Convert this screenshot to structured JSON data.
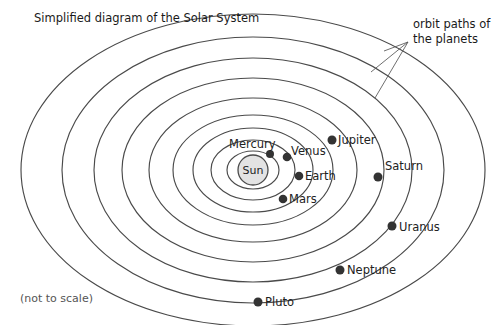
{
  "title": "Simplified diagram of the Solar System",
  "footnote": "(not to scale)",
  "annotation": {
    "line1": "orbit paths of",
    "line2": "the planets"
  },
  "sun": {
    "label": "Sun",
    "cx": 253,
    "cy": 170,
    "r": 15,
    "fill": "#e3e3e3",
    "stroke": "#4a4a4a"
  },
  "colors": {
    "orbit_stroke": "#4a4a4a",
    "planet_dot": "#333333",
    "text": "#222222",
    "footnote": "#555555",
    "background": "#ffffff"
  },
  "chart_data": {
    "type": "diagram",
    "title": "Simplified diagram of the Solar System",
    "note": "(not to scale)",
    "orbit_count": 9,
    "center": {
      "x": 253,
      "y": 170
    },
    "orbits": [
      {
        "name": "Mercury",
        "rx": 26,
        "ry": 19
      },
      {
        "name": "Venus",
        "rx": 42,
        "ry": 30
      },
      {
        "name": "Earth",
        "rx": 60,
        "ry": 42
      },
      {
        "name": "Mars",
        "rx": 80,
        "ry": 55
      },
      {
        "name": "Jupiter",
        "rx": 104,
        "ry": 72
      },
      {
        "name": "Saturn",
        "rx": 131,
        "ry": 92
      },
      {
        "name": "Uranus",
        "rx": 159,
        "ry": 112
      },
      {
        "name": "Neptune",
        "rx": 191,
        "ry": 133
      },
      {
        "name": "Pluto",
        "rx": 232,
        "ry": 156
      }
    ],
    "planets": [
      {
        "name": "Mercury",
        "dot_x": 270,
        "dot_y": 154,
        "dot_r": 4.0,
        "label_x": 229,
        "label_y": 148,
        "label_anchor": "start"
      },
      {
        "name": "Venus",
        "dot_x": 287,
        "dot_y": 157,
        "dot_r": 4.3,
        "label_x": 291,
        "label_y": 155,
        "label_anchor": "start"
      },
      {
        "name": "Earth",
        "dot_x": 299,
        "dot_y": 176,
        "dot_r": 4.3,
        "label_x": 305,
        "label_y": 180,
        "label_anchor": "start"
      },
      {
        "name": "Mars",
        "dot_x": 283,
        "dot_y": 199,
        "dot_r": 4.3,
        "label_x": 289,
        "label_y": 203,
        "label_anchor": "start"
      },
      {
        "name": "Jupiter",
        "dot_x": 332,
        "dot_y": 140,
        "dot_r": 4.5,
        "label_x": 338,
        "label_y": 144,
        "label_anchor": "start"
      },
      {
        "name": "Saturn",
        "dot_x": 378,
        "dot_y": 177,
        "dot_r": 4.5,
        "label_x": 385,
        "label_y": 170,
        "label_anchor": "start"
      },
      {
        "name": "Uranus",
        "dot_x": 392,
        "dot_y": 226,
        "dot_r": 4.5,
        "label_x": 399,
        "label_y": 231,
        "label_anchor": "start"
      },
      {
        "name": "Neptune",
        "dot_x": 340,
        "dot_y": 270,
        "dot_r": 4.5,
        "label_x": 347,
        "label_y": 274,
        "label_anchor": "start"
      },
      {
        "name": "Pluto",
        "dot_x": 258,
        "dot_y": 302,
        "dot_r": 4.5,
        "label_x": 265,
        "label_y": 306,
        "label_anchor": "start"
      }
    ],
    "annotation": {
      "text_lines": [
        "orbit paths of",
        "the planets"
      ],
      "text_x": 413,
      "text_y1": 28,
      "text_y2": 43,
      "apex": {
        "x": 408,
        "y": 42
      },
      "targets": [
        {
          "x": 384,
          "y": 51
        },
        {
          "x": 371,
          "y": 72
        },
        {
          "x": 375,
          "y": 98
        }
      ]
    },
    "title_pos": {
      "x": 34,
      "y": 22
    },
    "footnote_pos": {
      "x": 20,
      "y": 302
    }
  }
}
